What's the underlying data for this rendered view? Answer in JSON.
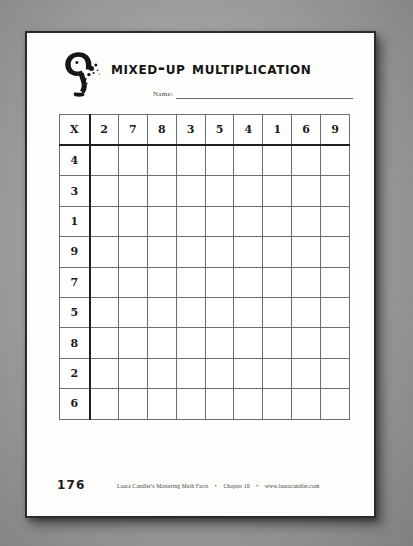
{
  "page": {
    "background_color": "#9c9c9c",
    "sheet_color": "#fdfdfb",
    "border_color": "#2b2b2b"
  },
  "header": {
    "logo_name": "numeral-nine-ink-logo",
    "title": "Mixed-Up Multiplication"
  },
  "name_field": {
    "label": "Name:",
    "value": ""
  },
  "worksheet": {
    "corner_label": "X",
    "column_headers": [
      "2",
      "7",
      "8",
      "3",
      "5",
      "4",
      "1",
      "6",
      "9"
    ],
    "row_headers": [
      "4",
      "3",
      "1",
      "9",
      "7",
      "5",
      "8",
      "2",
      "6"
    ],
    "cells": [
      [
        "",
        "",
        "",
        "",
        "",
        "",
        "",
        "",
        ""
      ],
      [
        "",
        "",
        "",
        "",
        "",
        "",
        "",
        "",
        ""
      ],
      [
        "",
        "",
        "",
        "",
        "",
        "",
        "",
        "",
        ""
      ],
      [
        "",
        "",
        "",
        "",
        "",
        "",
        "",
        "",
        ""
      ],
      [
        "",
        "",
        "",
        "",
        "",
        "",
        "",
        "",
        ""
      ],
      [
        "",
        "",
        "",
        "",
        "",
        "",
        "",
        "",
        ""
      ],
      [
        "",
        "",
        "",
        "",
        "",
        "",
        "",
        "",
        ""
      ],
      [
        "",
        "",
        "",
        "",
        "",
        "",
        "",
        "",
        ""
      ],
      [
        "",
        "",
        "",
        "",
        "",
        "",
        "",
        "",
        ""
      ]
    ]
  },
  "footer": {
    "page_number": "176",
    "credit_title": "Laura Candler's Mastering Math Facts",
    "separator": "•",
    "chapter": "Chapter 10",
    "website": "www.lauracandler.com"
  }
}
